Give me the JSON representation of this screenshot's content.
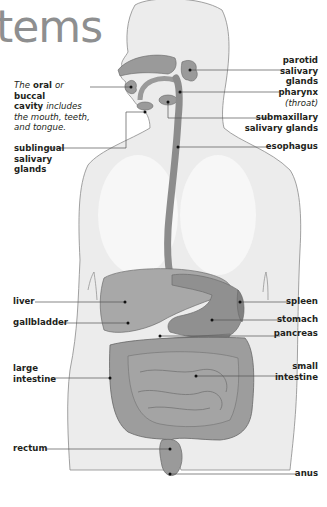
{
  "title": "tems",
  "labels": {
    "oral_cavity": {
      "prefix": "The",
      "oral": "oral",
      "or": "or",
      "buccal": "buccal",
      "cavity": "cavity",
      "rest1": "includes",
      "rest2": "the mouth, teeth,",
      "rest3": "and tongue."
    },
    "sublingual": [
      "sublingual",
      "salivary",
      "glands"
    ],
    "parotid": [
      "parotid",
      "salivary",
      "glands"
    ],
    "pharynx": {
      "name": "pharynx",
      "note": "(throat)"
    },
    "submaxillary": [
      "submaxillary",
      "salivary glands"
    ],
    "esophagus": "esophagus",
    "liver": "liver",
    "gallbladder": "gallbladder",
    "large_intestine": [
      "large",
      "intestine"
    ],
    "rectum": "rectum",
    "spleen": "spleen",
    "stomach": "stomach",
    "pancreas": "pancreas",
    "small_intestine": [
      "small",
      "intestine"
    ],
    "anus": "anus"
  },
  "colors": {
    "title": "#8e8f90",
    "body_fill": "#ececec",
    "body_outline": "#8a8a8a",
    "organ_fill": "#9a9a9a",
    "organ_dark": "#7d7d7d",
    "leader": "#555555",
    "text": "#231f20"
  }
}
